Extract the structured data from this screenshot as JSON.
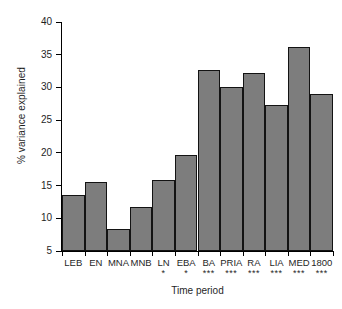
{
  "chart_data": {
    "type": "bar",
    "title": "",
    "xlabel": "Time period",
    "ylabel": "% variance explained",
    "ylim": [
      5,
      40
    ],
    "yticks": [
      5,
      10,
      15,
      20,
      25,
      30,
      35,
      40
    ],
    "grid": false,
    "legend": null,
    "categories": [
      "LEB",
      "EN",
      "MNA",
      "MNB",
      "LN",
      "EBA",
      "BA",
      "PRIA",
      "RA",
      "LIA",
      "MED",
      "1800"
    ],
    "values": [
      13.6,
      15.5,
      8.3,
      11.7,
      15.9,
      19.7,
      32.7,
      30.0,
      32.2,
      27.3,
      36.2,
      29.0
    ],
    "annotations": [
      "",
      "",
      "",
      "",
      "*",
      "*",
      "***",
      "***",
      "***",
      "***",
      "***",
      "***"
    ],
    "bar_fill_color": "#7d7d7d",
    "bar_edge_color": "#131313"
  }
}
